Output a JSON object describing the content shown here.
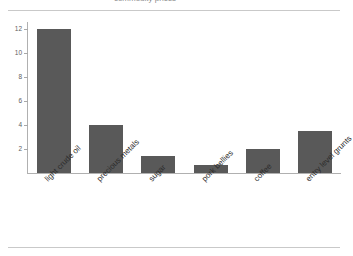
{
  "page": {
    "background_color": "#ffffff",
    "rule_color": "#c9c9c9",
    "title_sliver": "commodity prices"
  },
  "chart_data": {
    "type": "bar",
    "title": "",
    "xlabel": "",
    "ylabel": "",
    "categories": [
      "light crude oil",
      "precious metals",
      "sugar",
      "pork bellies",
      "coffee",
      "entry level grunts"
    ],
    "values": [
      12,
      4,
      1.4,
      0.65,
      2,
      3.5
    ],
    "ylim": [
      0,
      12.6
    ],
    "yticks": [
      2,
      4,
      6,
      8,
      10,
      12
    ],
    "ytick_labels": [
      "2",
      "4",
      "6",
      "8",
      "10",
      "12"
    ],
    "grid": false,
    "legend": false,
    "bar_color": "#595959",
    "axis_color": "#b0b0b0",
    "tick_label_color": "#5e5e5e",
    "category_label_color": "#2b2b2b",
    "category_label_rotation_deg": -45
  }
}
